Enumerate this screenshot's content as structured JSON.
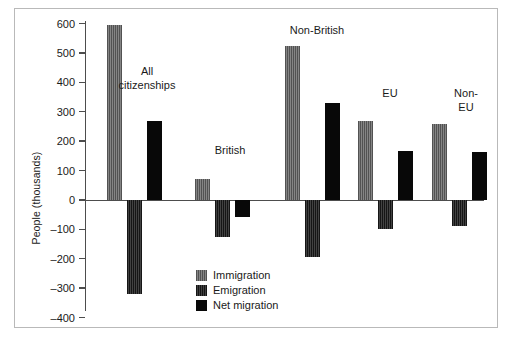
{
  "chart_data": {
    "type": "bar",
    "title": "",
    "xlabel": "",
    "ylabel": "People (thousands)",
    "ylim": [
      -400,
      600
    ],
    "ytick_labels": [
      "600",
      "500",
      "400",
      "300",
      "200",
      "100",
      "0",
      "–100",
      "–200",
      "–300",
      "–400"
    ],
    "ytick_values": [
      600,
      500,
      400,
      300,
      200,
      100,
      0,
      -100,
      -200,
      -300,
      -400
    ],
    "grid": false,
    "legend_position": "inside lower-center-left",
    "categories": [
      "All citizenships",
      "British",
      "Non-British",
      "EU",
      "Non-EU"
    ],
    "series": [
      {
        "name": "Immigration",
        "color": "#6e6e6e",
        "values": [
          595,
          70,
          525,
          268,
          257
        ]
      },
      {
        "name": "Emigration",
        "color": "#262626",
        "values": [
          -320,
          -125,
          -195,
          -100,
          -90
        ]
      },
      {
        "name": "Net migration",
        "color": "#080808",
        "values": [
          270,
          -57,
          330,
          165,
          163
        ]
      }
    ]
  },
  "legend": {
    "items": [
      {
        "label": "Immigration"
      },
      {
        "label": "Emigration"
      },
      {
        "label": "Net migration"
      }
    ]
  },
  "annotations": {
    "group_labels": [
      {
        "text": "All\ncitizenships"
      },
      {
        "text": "British"
      },
      {
        "text": "Non-British"
      },
      {
        "text": "EU"
      },
      {
        "text": "Non-EU"
      }
    ]
  }
}
